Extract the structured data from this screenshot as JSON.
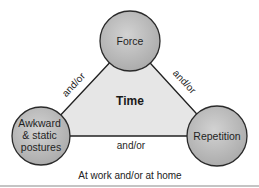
{
  "diagram": {
    "center_label": "Time",
    "caption": "At work and/or at home",
    "nodes": {
      "force": {
        "label": "Force"
      },
      "awkward": {
        "label_lines": [
          "Awkward",
          "& static",
          "postures"
        ]
      },
      "repetition": {
        "label": "Repetition"
      }
    },
    "edges": {
      "force_awkward": "and/or",
      "force_repetition": "and/or",
      "awkward_repetition": "and/or"
    },
    "colors": {
      "circle_fill": "#b9b9b9",
      "circle_stroke": "#2a2a2a",
      "triangle_fill": "#e6e6e6",
      "line": "#222222",
      "bottom_rule": "#bdbdbd"
    }
  }
}
